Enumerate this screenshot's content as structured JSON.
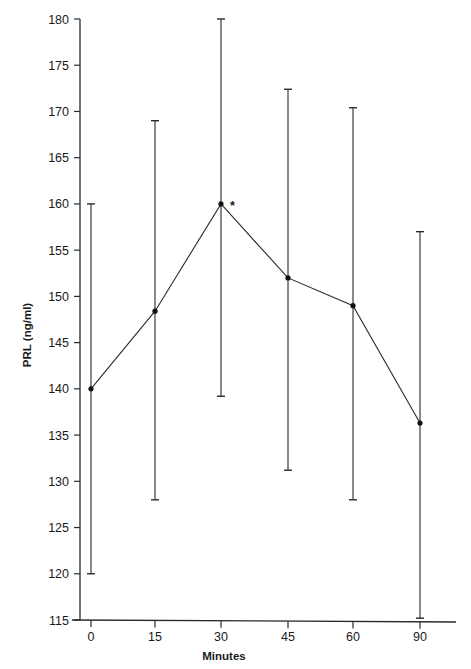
{
  "chart_data": {
    "type": "line",
    "title": "",
    "xlabel": "Minutes",
    "ylabel": "PRL (ng/ml)",
    "categories": [
      "0",
      "15",
      "30",
      "45",
      "60",
      "90"
    ],
    "series": [
      {
        "name": "PRL mean",
        "values": [
          140,
          148.4,
          160,
          152,
          149,
          136.3
        ],
        "error_upper": [
          160,
          169,
          180,
          172.4,
          170.4,
          157
        ],
        "error_lower": [
          120,
          128,
          139.2,
          131.2,
          128,
          115.2
        ]
      }
    ],
    "yticks": [
      115,
      120,
      125,
      130,
      135,
      140,
      145,
      150,
      155,
      160,
      165,
      170,
      175,
      180
    ],
    "ylim": [
      115,
      180
    ],
    "grid": false,
    "legend": null,
    "annotations": [
      {
        "text": "*",
        "category": "30",
        "note": "significance marker next to 30-min point"
      }
    ]
  },
  "layout": {
    "line_color": "#2a2a2a",
    "text_color": "#1a1a1a"
  }
}
